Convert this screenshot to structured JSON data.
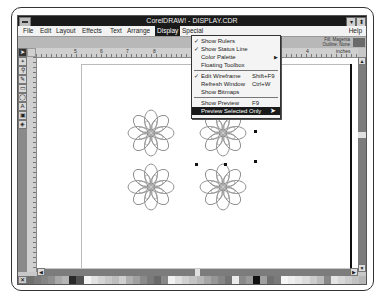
{
  "window": {
    "title": "CorelDRAW! - DISPLAY.CDR",
    "minimize_icon": "down-triangle",
    "maximize_icon": "updown-triangle"
  },
  "menubar": {
    "items": [
      {
        "label": "File",
        "x": 3
      },
      {
        "label": "Edit",
        "x": 20
      },
      {
        "label": "Layout",
        "x": 36
      },
      {
        "label": "Effects",
        "x": 62
      },
      {
        "label": "Text",
        "x": 90
      },
      {
        "label": "Arrange",
        "x": 107
      },
      {
        "label": "Display",
        "x": 137,
        "active": true
      },
      {
        "label": "Special",
        "x": 162
      }
    ],
    "help": "Help"
  },
  "status": {
    "line1": "Fill: Magenta",
    "line2": "Outline: None",
    "swatch_color": "#6a6a6a"
  },
  "ruler": {
    "units": "inches",
    "h_labels": [
      {
        "text": "5",
        "x": 38
      },
      {
        "text": "6",
        "x": 64
      },
      {
        "text": "7",
        "x": 90
      },
      {
        "text": "8",
        "x": 117
      },
      {
        "text": "1",
        "x": 160
      },
      {
        "text": "2",
        "x": 190
      },
      {
        "text": "3",
        "x": 230
      },
      {
        "text": "4",
        "x": 270
      },
      {
        "text": "inches",
        "x": 300
      }
    ]
  },
  "toolbox": {
    "tools": [
      {
        "name": "pick-tool",
        "glyph": "➤",
        "selected": true
      },
      {
        "name": "shape-tool",
        "glyph": "⌖"
      },
      {
        "name": "zoom-tool",
        "glyph": "⚲"
      },
      {
        "name": "pencil-tool",
        "glyph": "✎"
      },
      {
        "name": "rectangle-tool",
        "glyph": "▭"
      },
      {
        "name": "ellipse-tool",
        "glyph": "◯"
      },
      {
        "name": "text-tool",
        "glyph": "A"
      },
      {
        "name": "outline-tool",
        "glyph": "▣"
      },
      {
        "name": "fill-tool",
        "glyph": "◈"
      }
    ]
  },
  "display_menu": {
    "items": [
      {
        "label": "Show Rulers",
        "checked": true
      },
      {
        "label": "Show Status Line",
        "checked": true
      },
      {
        "label": "Color Palette",
        "submenu": true
      },
      {
        "label": "Floating Toolbox"
      },
      {
        "separator": true
      },
      {
        "label": "Edit Wireframe",
        "checked": true,
        "shortcut": "Shift+F9"
      },
      {
        "label": "Refresh Window",
        "shortcut": "Ctrl+W"
      },
      {
        "label": "Show Bitmaps"
      },
      {
        "separator": true
      },
      {
        "label": "Show Preview",
        "shortcut": "F9"
      },
      {
        "label": "Preview Selected Only",
        "highlighted": true
      }
    ]
  },
  "palette": {
    "colors": [
      "#6f6f6f",
      "#7a7a7a",
      "#858585",
      "#8f8f8f",
      "#a8a8a8",
      "#b5b5b5",
      "#2a2a2a",
      "#505050",
      "#f4f4f4",
      "#e2e2e2",
      "#d4d4d4",
      "#c8c8c8",
      "#bdbdbd",
      "#cfcfcf",
      "#b0b0b0",
      "#a0a0a0",
      "#8a8a8a",
      "#7a7a7a",
      "#6a6a6a",
      "#888888",
      "#f2f2f2",
      "#e0e0e0",
      "#d0d0d0",
      "#c4c4c4",
      "#b8b8b8",
      "#a6a6a6",
      "#969696",
      "#868686",
      "#747474",
      "#ececec",
      "#8a8a8a",
      "#9a9a9a",
      "#111111",
      "#a0a0a0",
      "#707070",
      "#7a7a7a",
      "#f6f6f6",
      "#eeeeee",
      "#e6e6e6",
      "#dcdcdc",
      "#cccccc",
      "#bcbcbc",
      "#888888",
      "#e4e4e4",
      "#d8d8d8",
      "#cdcdcd",
      "#c2c2c2",
      "#b6b6b6"
    ]
  },
  "drawing": {
    "flowers": [
      {
        "cx": 151,
        "cy": 133
      },
      {
        "cx": 223,
        "cy": 133
      },
      {
        "cx": 151,
        "cy": 187
      },
      {
        "cx": 223,
        "cy": 187
      }
    ],
    "handles": [
      {
        "x": 254,
        "y": 100
      },
      {
        "x": 254,
        "y": 130
      },
      {
        "x": 254,
        "y": 160
      },
      {
        "x": 195,
        "y": 163
      },
      {
        "x": 224,
        "y": 163
      }
    ]
  }
}
